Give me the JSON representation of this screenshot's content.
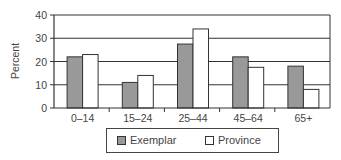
{
  "chart_data": {
    "type": "bar",
    "title": "",
    "xlabel": "",
    "ylabel": "Percent",
    "ylim": [
      0,
      40
    ],
    "yticks": [
      0,
      10,
      20,
      30,
      40
    ],
    "grid": true,
    "legend_position": "bottom",
    "categories": [
      "0–14",
      "15–24",
      "25–44",
      "45–64",
      "65+"
    ],
    "series": [
      {
        "name": "Exemplar",
        "color": "#999999",
        "values": [
          22,
          11,
          27.5,
          22,
          18
        ]
      },
      {
        "name": "Province",
        "color": "#ffffff",
        "values": [
          23,
          14,
          34,
          17.5,
          8
        ]
      }
    ]
  },
  "legend": {
    "items": [
      "Exemplar",
      "Province"
    ]
  }
}
